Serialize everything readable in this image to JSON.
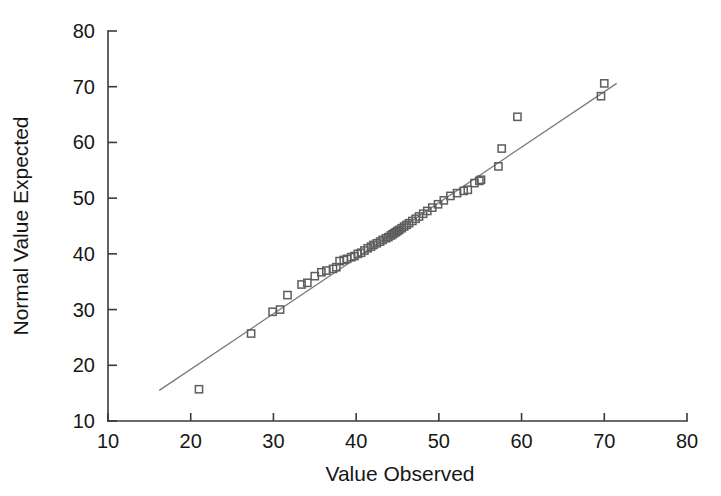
{
  "chart_data": {
    "type": "scatter",
    "title": "",
    "subtitle": "",
    "xlabel": "Value Observed",
    "ylabel": "Normal Value Expected",
    "xlim": [
      10,
      80
    ],
    "ylim": [
      10,
      80
    ],
    "xticks": [
      10,
      20,
      30,
      40,
      50,
      60,
      70,
      80
    ],
    "yticks": [
      10,
      20,
      30,
      40,
      50,
      60,
      70,
      80
    ],
    "xtick_labels": [
      "10",
      "20",
      "30",
      "40",
      "50",
      "60",
      "70",
      "80"
    ],
    "ytick_labels": [
      "10",
      "20",
      "30",
      "40",
      "50",
      "60",
      "70",
      "80"
    ],
    "grid": false,
    "legend": false,
    "legend_position": "none",
    "marker_style": "open-square",
    "marker_color": "#5e5e5e",
    "line_color": "#7a7a7a",
    "axis_color": "#3a3a3a",
    "reference_line": {
      "label": "normal reference line",
      "x": [
        16.2,
        71.5
      ],
      "y": [
        15.5,
        70.6
      ]
    },
    "series": [
      {
        "name": "Normal Q-Q points",
        "points": [
          [
            21.0,
            15.7
          ],
          [
            27.3,
            25.7
          ],
          [
            29.9,
            29.6
          ],
          [
            30.8,
            30.0
          ],
          [
            31.7,
            32.6
          ],
          [
            33.4,
            34.5
          ],
          [
            34.1,
            34.8
          ],
          [
            35.0,
            36.0
          ],
          [
            35.8,
            36.7
          ],
          [
            36.4,
            37.0
          ],
          [
            37.2,
            37.3
          ],
          [
            37.6,
            37.6
          ],
          [
            38.0,
            38.7
          ],
          [
            38.5,
            38.9
          ],
          [
            38.9,
            39.1
          ],
          [
            39.4,
            39.4
          ],
          [
            39.8,
            39.6
          ],
          [
            40.2,
            40.0
          ],
          [
            40.6,
            40.2
          ],
          [
            41.0,
            40.6
          ],
          [
            41.4,
            41.0
          ],
          [
            41.8,
            41.3
          ],
          [
            42.1,
            41.6
          ],
          [
            42.5,
            41.9
          ],
          [
            42.9,
            42.2
          ],
          [
            43.2,
            42.5
          ],
          [
            43.6,
            42.8
          ],
          [
            43.9,
            43.0
          ],
          [
            44.2,
            43.3
          ],
          [
            44.4,
            43.5
          ],
          [
            44.6,
            43.7
          ],
          [
            44.8,
            43.9
          ],
          [
            45.0,
            44.1
          ],
          [
            45.2,
            44.3
          ],
          [
            45.5,
            44.6
          ],
          [
            45.8,
            44.9
          ],
          [
            46.1,
            45.2
          ],
          [
            46.4,
            45.5
          ],
          [
            46.8,
            45.9
          ],
          [
            47.2,
            46.3
          ],
          [
            47.6,
            46.7
          ],
          [
            48.1,
            47.2
          ],
          [
            48.6,
            47.7
          ],
          [
            49.2,
            48.3
          ],
          [
            49.9,
            48.9
          ],
          [
            50.6,
            49.6
          ],
          [
            51.4,
            50.4
          ],
          [
            52.2,
            50.9
          ],
          [
            53.0,
            51.3
          ],
          [
            53.5,
            51.5
          ],
          [
            54.3,
            52.7
          ],
          [
            54.9,
            53.1
          ],
          [
            55.1,
            53.3
          ],
          [
            57.2,
            55.7
          ],
          [
            57.6,
            58.9
          ],
          [
            59.5,
            64.6
          ],
          [
            69.6,
            68.3
          ],
          [
            70.0,
            70.6
          ]
        ]
      }
    ]
  },
  "axes": {
    "x_label": "Value Observed",
    "y_label": "Normal Value Expected"
  }
}
